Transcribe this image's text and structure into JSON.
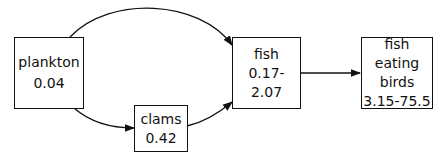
{
  "diagram": {
    "nodes": [
      {
        "id": "plankton",
        "label": "plankton",
        "value": "0.04"
      },
      {
        "id": "clams",
        "label": "clams",
        "value": "0.42"
      },
      {
        "id": "fish",
        "label": "fish",
        "value": "0.17-2.07"
      },
      {
        "id": "birds",
        "label_line1": "fish eating",
        "label_line2": "birds",
        "value": "3.15-75.5"
      }
    ],
    "edges": [
      {
        "from": "plankton",
        "to": "fish"
      },
      {
        "from": "plankton",
        "to": "clams"
      },
      {
        "from": "clams",
        "to": "fish"
      },
      {
        "from": "fish",
        "to": "birds"
      }
    ]
  }
}
